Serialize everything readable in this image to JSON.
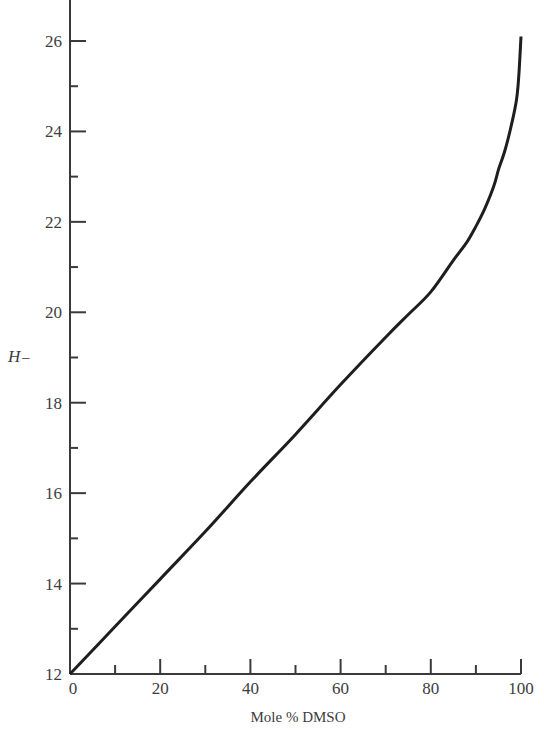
{
  "chart_data": {
    "type": "line",
    "title": "",
    "xlabel": "Mole % DMSO",
    "ylabel": "H",
    "ylabel_subscript": "−",
    "xlim": [
      0,
      100
    ],
    "ylim": [
      12,
      26
    ],
    "grid": false,
    "legend": null,
    "x_major_ticks": [
      0,
      20,
      40,
      60,
      80,
      100
    ],
    "x_minor_ticks": [
      10,
      30,
      50,
      70,
      90
    ],
    "y_major_ticks": [
      12,
      14,
      16,
      18,
      20,
      22,
      24,
      26
    ],
    "y_minor_ticks": [
      13,
      15,
      17,
      19,
      21,
      23,
      25
    ],
    "x_tick_labels": [
      "0",
      "20",
      "40",
      "60",
      "80",
      "100"
    ],
    "y_tick_labels": [
      "12",
      "14",
      "16",
      "18",
      "20",
      "22",
      "24",
      "26"
    ],
    "series": [
      {
        "name": "H− vs Mole % DMSO",
        "x": [
          0,
          10,
          20,
          30,
          40,
          50,
          60,
          70,
          75,
          80,
          85,
          88,
          90,
          92,
          94,
          95,
          96.5,
          98,
          99,
          99.5,
          100
        ],
        "y": [
          12.0,
          13.05,
          14.1,
          15.15,
          16.25,
          17.3,
          18.4,
          19.45,
          19.95,
          20.45,
          21.15,
          21.55,
          21.9,
          22.3,
          22.8,
          23.15,
          23.6,
          24.2,
          24.7,
          25.2,
          26.1
        ]
      }
    ]
  },
  "colors": {
    "axis": "#3a3a3a",
    "line": "#1e1e1e",
    "background": "#ffffff"
  }
}
